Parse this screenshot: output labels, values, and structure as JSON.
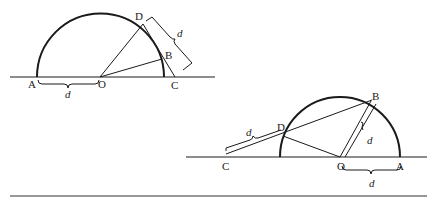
{
  "figure1": {
    "labels": {
      "A": "A",
      "O": "O",
      "B": "B",
      "C": "C",
      "D": "D"
    },
    "distance_label_AO": "d",
    "distance_label_DC": "d"
  },
  "figure2": {
    "labels": {
      "A": "A",
      "O": "O",
      "B": "B",
      "C": "C",
      "D": "D"
    },
    "distance_label_OA": "d",
    "distance_label_OB": "d",
    "distance_label_CD": "d"
  },
  "colors": {
    "stroke": "#1a1a1a",
    "background": "#ffffff"
  }
}
